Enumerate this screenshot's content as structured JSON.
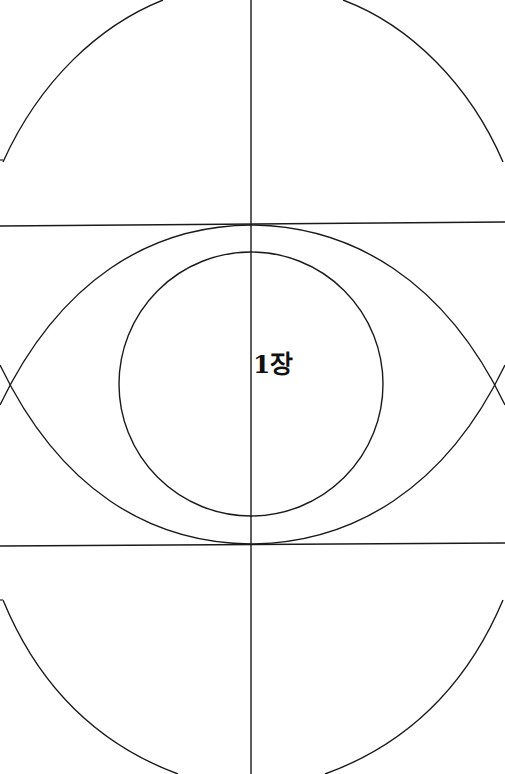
{
  "diagram": {
    "center_label": "1장",
    "line_color": "#1a1a1a",
    "background": "#ffffff",
    "elements": [
      {
        "type": "vertical-axis-line",
        "x": 251
      },
      {
        "type": "horizontal-line-upper",
        "y_left": 226,
        "y_right": 222
      },
      {
        "type": "horizontal-line-lower",
        "y_left": 546,
        "y_right": 543
      },
      {
        "type": "outer-ellipse-top-arc"
      },
      {
        "type": "outer-ellipse-bottom-arc"
      },
      {
        "type": "vesica-lens",
        "top_y": 225,
        "bottom_y": 544,
        "left_x": 5,
        "right_x": 500
      },
      {
        "type": "inner-circle",
        "cx": 251,
        "cy": 384,
        "r": 132
      }
    ]
  }
}
